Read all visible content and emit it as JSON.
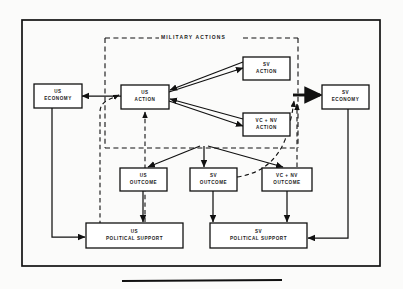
{
  "figure": {
    "type": "block-flow-diagram",
    "title": "",
    "group_label": "MILITARY ACTIONS",
    "frame": {
      "x": 22,
      "y": 20,
      "width": 358,
      "height": 246
    },
    "group_box": {
      "x": 105,
      "y": 38,
      "width": 193,
      "height": 110
    },
    "rule_below": {
      "x": 122,
      "y": 281,
      "width": 160
    }
  },
  "nodes": [
    {
      "id": "us-economy",
      "lines": [
        "US",
        "ECONOMY"
      ],
      "x": 34,
      "y": 84,
      "width": 48,
      "height": 24
    },
    {
      "id": "us-action",
      "lines": [
        "US",
        "ACTION"
      ],
      "x": 121,
      "y": 85,
      "width": 48,
      "height": 24
    },
    {
      "id": "sv-action",
      "lines": [
        "SV",
        "ACTION"
      ],
      "x": 243,
      "y": 57,
      "width": 47,
      "height": 23
    },
    {
      "id": "vc-nv-action",
      "lines": [
        "VC + NV",
        "ACTION"
      ],
      "x": 243,
      "y": 113,
      "width": 47,
      "height": 23
    },
    {
      "id": "sv-economy",
      "lines": [
        "SV",
        "ECONOMY"
      ],
      "x": 322,
      "y": 85,
      "width": 47,
      "height": 24
    },
    {
      "id": "us-outcome",
      "lines": [
        "US",
        "OUTCOME"
      ],
      "x": 120,
      "y": 168,
      "width": 47,
      "height": 23
    },
    {
      "id": "sv-outcome",
      "lines": [
        "SV",
        "OUTCOME"
      ],
      "x": 190,
      "y": 168,
      "width": 47,
      "height": 23
    },
    {
      "id": "vc-nv-outcome",
      "lines": [
        "VC + NV",
        "OUTCOME"
      ],
      "x": 262,
      "y": 168,
      "width": 50,
      "height": 23
    },
    {
      "id": "us-political-support",
      "lines": [
        "US",
        "POLITICAL  SUPPORT"
      ],
      "x": 86,
      "y": 223,
      "width": 97,
      "height": 25
    },
    {
      "id": "sv-political-support",
      "lines": [
        "SV",
        "POLITICAL  SUPPORT"
      ],
      "x": 210,
      "y": 223,
      "width": 97,
      "height": 25
    }
  ],
  "edges": [
    {
      "id": "us-action-to-us-economy",
      "from": "us-action",
      "to": "us-economy",
      "style": "solid"
    },
    {
      "id": "sv-action-to-us-action",
      "from": "sv-action",
      "to": "us-action",
      "style": "solid"
    },
    {
      "id": "us-action-to-sv-action",
      "from": "us-action",
      "to": "sv-action",
      "style": "solid"
    },
    {
      "id": "us-action-to-vc-nv-action",
      "from": "us-action",
      "to": "vc-nv-action",
      "style": "solid"
    },
    {
      "id": "vc-nv-action-to-us-action",
      "from": "vc-nv-action",
      "to": "us-action",
      "style": "solid"
    },
    {
      "id": "military-actions-to-sv-economy",
      "from": "military-actions",
      "to": "sv-economy",
      "style": "solid-bold"
    },
    {
      "id": "actions-to-us-outcome",
      "from": "military-actions",
      "to": "us-outcome",
      "style": "solid"
    },
    {
      "id": "actions-to-sv-outcome",
      "from": "military-actions",
      "to": "sv-outcome",
      "style": "solid"
    },
    {
      "id": "actions-to-vc-nv-outcome",
      "from": "military-actions",
      "to": "vc-nv-outcome",
      "style": "solid"
    },
    {
      "id": "us-outcome-to-us-political-support",
      "from": "us-outcome",
      "to": "us-political-support",
      "style": "solid"
    },
    {
      "id": "sv-outcome-to-sv-political-support",
      "from": "sv-outcome",
      "to": "sv-political-support",
      "style": "solid"
    },
    {
      "id": "vc-nv-outcome-to-sv-political-support",
      "from": "vc-nv-outcome",
      "to": "sv-political-support",
      "style": "solid"
    },
    {
      "id": "us-economy-to-us-political-support",
      "from": "us-economy",
      "to": "us-political-support",
      "style": "solid"
    },
    {
      "id": "sv-economy-to-sv-political-support",
      "from": "sv-economy",
      "to": "sv-political-support",
      "style": "solid"
    },
    {
      "id": "us-political-support-to-us-action",
      "from": "us-political-support",
      "to": "us-action",
      "style": "dashed"
    },
    {
      "id": "us-support-loop-to-us-action",
      "from": "us-political-support",
      "to": "us-action",
      "style": "dashed"
    },
    {
      "id": "sv-outcome-to-sv-economy-feed",
      "from": "sv-outcome",
      "to": "sv-economy",
      "style": "dashed"
    },
    {
      "id": "vc-nv-outcome-to-sv-economy-feed",
      "from": "vc-nv-outcome",
      "to": "sv-economy",
      "style": "dashed"
    }
  ],
  "colors": {
    "ink": "#111111",
    "paper": "#fbfbfa",
    "frame": "#111111"
  }
}
